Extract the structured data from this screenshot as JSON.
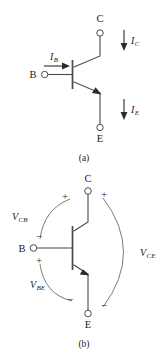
{
  "figure": {
    "title_caption_a": "(a)",
    "title_caption_b": "(b)",
    "device_type": "NPN bipolar junction transistor",
    "colors": {
      "background": "#ffffff",
      "wire": "#4a4a4a",
      "arc": "#6b6b6b",
      "arrow": "#2b2b2b",
      "text": "#1a1a1a"
    }
  },
  "panel_a": {
    "caption": "(a)",
    "terminals": {
      "collector": "C",
      "base": "B",
      "emitter": "E"
    },
    "currents": [
      {
        "symbol": "I",
        "subscript": "B",
        "label": "I_B",
        "direction": "right-into-base"
      },
      {
        "symbol": "I",
        "subscript": "C",
        "label": "I_C",
        "direction": "down-into-collector"
      },
      {
        "symbol": "I",
        "subscript": "E",
        "label": "I_E",
        "direction": "down-out-of-emitter"
      }
    ]
  },
  "panel_b": {
    "caption": "(b)",
    "terminals": {
      "collector": "C",
      "base": "B",
      "emitter": "E"
    },
    "voltages": [
      {
        "symbol": "V",
        "subscript": "CB",
        "label": "V_CB",
        "plus_at": "collector-side",
        "minus_at": "base-side",
        "plus_sign": "+",
        "minus_sign": "−"
      },
      {
        "symbol": "V",
        "subscript": "BE",
        "label": "V_BE",
        "plus_at": "base-side",
        "minus_at": "emitter-side",
        "plus_sign": "+",
        "minus_sign": "−"
      },
      {
        "symbol": "V",
        "subscript": "CE",
        "label": "V_CE",
        "plus_at": "collector",
        "minus_at": "emitter",
        "plus_sign": "+",
        "minus_sign": "−"
      }
    ]
  }
}
